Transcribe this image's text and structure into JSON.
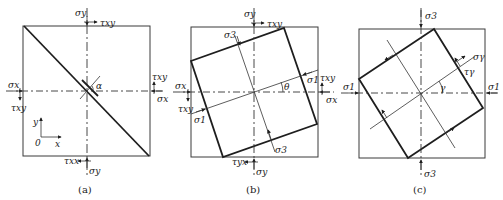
{
  "figure": {
    "panels": [
      {
        "id": "a",
        "caption": "(a)",
        "labels": {
          "sigma_y_top": "σy",
          "tau_xy_top": "τxy",
          "sigma_x_left": "σx",
          "tau_xy_left": "τxy",
          "sigma_x_right": "σx",
          "tau_xy_right": "τxy",
          "sigma_y_bottom": "σy",
          "tau_xy_bottom": "τxx",
          "angle": "α",
          "axis_y": "y",
          "axis_x": "x",
          "origin": "0"
        }
      },
      {
        "id": "b",
        "caption": "(b)",
        "labels": {
          "sigma_y_top": "σy",
          "tau_xy_top": "τxy",
          "sigma_x_left": "σx",
          "tau_xy_left": "τxy",
          "sigma_x_right": "σx",
          "tau_xy_right": "τxy",
          "sigma_y_bottom": "σy",
          "tau_yx_bottom": "τyx",
          "sigma3_top": "σ3",
          "sigma3_bottom": "σ3",
          "sigma1_left": "σ1",
          "sigma1_right": "σ1",
          "angle": "θ"
        }
      },
      {
        "id": "c",
        "caption": "(c)",
        "labels": {
          "sigma3_top": "σ3",
          "sigma3_bottom": "σ3",
          "sigma1_left": "σ1",
          "sigma1_right": "σ1",
          "sigma_gamma": "σγ",
          "tau_gamma": "τγ",
          "angle": "γ"
        }
      }
    ]
  }
}
